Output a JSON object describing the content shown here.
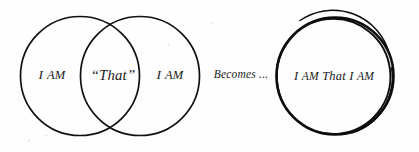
{
  "diagram": {
    "background_color": "#fefefe",
    "stroke_color": "#111111",
    "text_color": "#1a1a1a",
    "venn": {
      "left_circle": {
        "label_first": "I ",
        "label_rest": "AM",
        "cx": 80,
        "cy": 76,
        "r": 59.5
      },
      "right_circle": {
        "label_first": "I ",
        "label_rest": "AM",
        "cx": 140,
        "cy": 76,
        "r": 59.5
      },
      "intersection": {
        "label": "“That”",
        "cx": 113,
        "cy": 76
      }
    },
    "connector": {
      "label": "Becomes ...",
      "x": 241,
      "y": 76
    },
    "result_circle": {
      "label_parts": {
        "a": "I ",
        "b": "AM",
        "c": " That I ",
        "d": "AM"
      },
      "full_label": "I AM That I AM",
      "cx": 335,
      "cy": 76,
      "r": 58,
      "style": "double-stroke hand drawn"
    }
  }
}
